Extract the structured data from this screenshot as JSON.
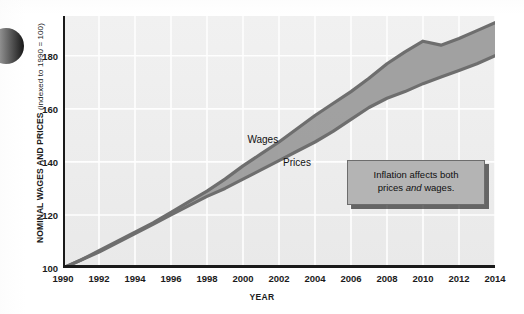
{
  "figure": {
    "bullet_icon": "filled-circle-bullet"
  },
  "chart_data": {
    "type": "area",
    "title": "",
    "subtitle": "",
    "xlabel": "YEAR",
    "ylabel": "NOMINAL WAGES AND PRICES",
    "ylabel_note": "(indexed to 1990 = 100)",
    "xlim": [
      1990,
      2014
    ],
    "ylim": [
      100,
      195
    ],
    "xticks": [
      1990,
      1992,
      1994,
      1996,
      1998,
      2000,
      2002,
      2004,
      2006,
      2008,
      2010,
      2012,
      2014
    ],
    "yticks": [
      100,
      120,
      140,
      160,
      180
    ],
    "grid": true,
    "grid_color": "#ffffff",
    "plot_background": "#eeeeee",
    "legend": "inline-labels",
    "fill_color": "#9c9c9c",
    "line_color": "#6e6e6e",
    "x": [
      1990,
      1991,
      1992,
      1993,
      1994,
      1995,
      1996,
      1997,
      1998,
      1999,
      2000,
      2001,
      2002,
      2003,
      2004,
      2005,
      2006,
      2007,
      2008,
      2009,
      2010,
      2011,
      2012,
      2013,
      2014
    ],
    "series": [
      {
        "name": "Wages",
        "label_x": 2001.1,
        "label_y": 148.5,
        "values": [
          100,
          103,
          106.5,
          110,
          113.5,
          117,
          121,
          125,
          129,
          133.5,
          138.5,
          143,
          147.5,
          152.5,
          157.5,
          162,
          166.5,
          171.5,
          177,
          181.5,
          185.5,
          184,
          186.5,
          189.5,
          192.5
        ]
      },
      {
        "name": "Prices",
        "label_x": 2003.0,
        "label_y": 140.0,
        "values": [
          100,
          103,
          106,
          109.5,
          113,
          116.5,
          120,
          123.5,
          127,
          130,
          133.5,
          137,
          140.5,
          144,
          147.5,
          151.5,
          156,
          160.5,
          164,
          166.5,
          169.5,
          172,
          174.5,
          177,
          180
        ]
      }
    ],
    "annotations": [
      {
        "name": "inflation-callout",
        "text_line1": "Inflation affects both",
        "text_line2_pre": "prices ",
        "text_line2_em": "and",
        "text_line2_post": " wages."
      }
    ]
  }
}
